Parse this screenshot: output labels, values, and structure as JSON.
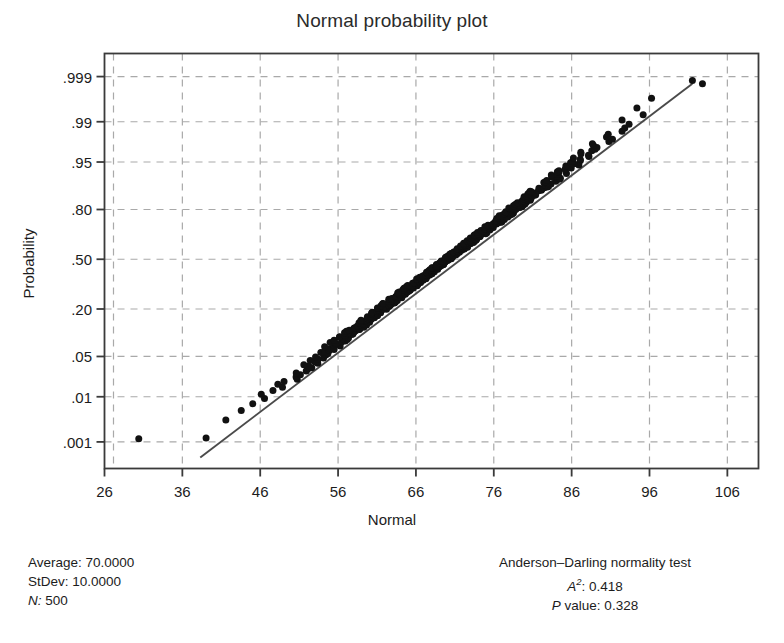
{
  "chart_data": {
    "type": "scatter",
    "title": "Normal probability plot",
    "xlabel": "Normal",
    "ylabel": "Probability",
    "grid": true,
    "legend_position": "none",
    "xlim": [
      26,
      110
    ],
    "xticks": [
      26,
      36,
      46,
      56,
      66,
      76,
      86,
      96,
      106
    ],
    "xticklabels": [
      "26",
      "36",
      "46",
      "56",
      "66",
      "76",
      "86",
      "96",
      "106"
    ],
    "yticks_probability": [
      0.999,
      0.99,
      0.95,
      0.8,
      0.5,
      0.2,
      0.05,
      0.01,
      0.001
    ],
    "yticklabels": [
      ".999",
      ".99",
      ".95",
      ".80",
      ".50",
      ".20",
      ".05",
      ".01",
      ".001"
    ],
    "ylim_probability": [
      0.0002,
      0.99975
    ],
    "reference_line": {
      "description": "fitted normal reference line",
      "x_start": 38.3,
      "x_end": 101.5,
      "p_start": 0.0004,
      "p_end": 0.9985
    },
    "distribution": {
      "mean": 70.0,
      "stdev": 10.0,
      "n": 500
    },
    "marker": {
      "shape": "circle",
      "color": "#111111",
      "size_px": 7
    },
    "outlier_points": [
      {
        "x": 30.4,
        "p": 0.0012,
        "note": "low-tail outlier left of line"
      },
      {
        "x": 102.8,
        "p": 0.9985,
        "note": "high-tail outlier right of line"
      }
    ],
    "series_note": "500 ordered normal scores plotted against sample quantiles; points form a dense near-linear band along the reference line"
  },
  "header": {
    "title": "Normal probability plot"
  },
  "axes": {
    "x_title": "Normal",
    "y_title": "Probability"
  },
  "stats_left": {
    "average_label": "Average:",
    "average_value": "70.0000",
    "stdev_label": "StDev:",
    "stdev_value": "10.0000",
    "n_label": "N:",
    "n_value": "500"
  },
  "stats_right": {
    "test_title": "Anderson–Darling normality test",
    "a_squared_label": "A",
    "a_squared_sup": "2",
    "a_squared_value": ": 0.418",
    "p_value_label": "P",
    "p_value_text": " value:   0.328"
  },
  "colors": {
    "frame": "#3a3a3a",
    "grid": "#a9a9a9",
    "marker": "#111111",
    "reference_line": "#4a4a4a",
    "text": "#1c1c1c"
  }
}
